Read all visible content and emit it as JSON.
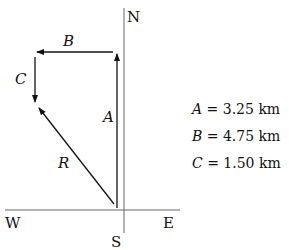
{
  "compass": {
    "north": "N",
    "south": "S",
    "west": "W",
    "east": "E"
  },
  "vectors": [
    {
      "name": "A",
      "label": "A"
    },
    {
      "name": "B",
      "label": "B"
    },
    {
      "name": "C",
      "label": "C"
    },
    {
      "name": "R",
      "label": "R"
    }
  ],
  "equations": [
    {
      "var": "A",
      "eq": " = 3.25 km"
    },
    {
      "var": "B",
      "eq": " = 4.75 km"
    },
    {
      "var": "C",
      "eq": " = 1.50 km"
    }
  ],
  "colors": {
    "line": "#111111",
    "axis": "#555555"
  }
}
